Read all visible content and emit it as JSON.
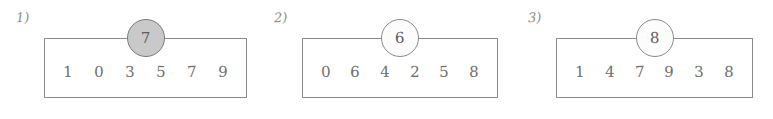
{
  "page": {
    "background_color": "#ffffff",
    "ink_color": "#8a8a8a",
    "text_color": "#6f6f6f",
    "highlight_fill": "#c9c9c9",
    "plain_fill": "#fcfcfc"
  },
  "groups": [
    {
      "label": "1)",
      "pointer": {
        "value": "7",
        "filled": true,
        "icon": "circle-marker-icon"
      },
      "cells": [
        "1",
        "0",
        "3",
        "5",
        "7",
        "9"
      ]
    },
    {
      "label": "2)",
      "pointer": {
        "value": "6",
        "filled": false,
        "icon": "circle-marker-icon"
      },
      "cells": [
        "0",
        "6",
        "4",
        "2",
        "5",
        "8"
      ]
    },
    {
      "label": "3)",
      "pointer": {
        "value": "8",
        "filled": false,
        "icon": "circle-marker-icon"
      },
      "cells": [
        "1",
        "4",
        "7",
        "9",
        "3",
        "8"
      ]
    }
  ]
}
